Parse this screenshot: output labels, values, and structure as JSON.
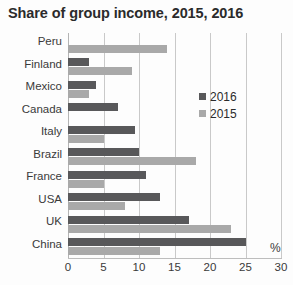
{
  "chart_data": {
    "type": "bar",
    "orientation": "horizontal",
    "title": "Share of group income, 2015, 2016",
    "xlabel": "%",
    "ylabel": "",
    "xlim": [
      0,
      30
    ],
    "xticks": [
      0,
      5,
      10,
      15,
      20,
      25,
      30
    ],
    "xtick_labels": [
      "0",
      "5",
      "10",
      "15",
      "20",
      "25",
      "30"
    ],
    "grid": true,
    "grid_axis": "x",
    "legend_position": "inside-right-upper",
    "categories": [
      "Peru",
      "Finland",
      "Mexico",
      "Canada",
      "Italy",
      "Brazil",
      "France",
      "USA",
      "UK",
      "China"
    ],
    "series": [
      {
        "name": "2016",
        "color": "#58585a",
        "values": [
          0,
          3,
          4,
          7,
          9.5,
          10,
          11,
          13,
          17,
          25
        ]
      },
      {
        "name": "2015",
        "color": "#a9a9a9",
        "values": [
          14,
          9,
          3,
          0,
          5,
          18,
          5,
          8,
          23,
          13
        ]
      }
    ]
  },
  "legend": {
    "entries": [
      {
        "label": "2016"
      },
      {
        "label": "2015"
      }
    ]
  },
  "axis": {
    "unit_label": "%"
  }
}
